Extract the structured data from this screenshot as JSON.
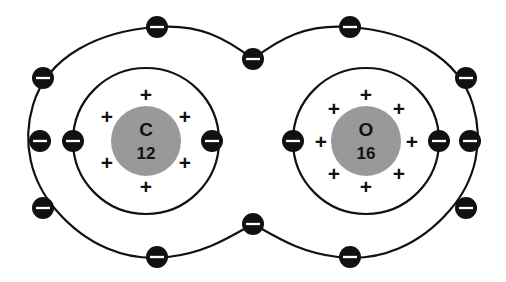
{
  "diagram": {
    "background_color": "#ffffff",
    "line_color": "#111111",
    "nucleus_color": "#999999",
    "electron_color": "#111111",
    "electron_bar_color": "#ffffff",
    "proton_symbol": "+",
    "electron_symbol": "−"
  },
  "atoms": [
    {
      "id": "carbon",
      "element_symbol": "C",
      "mass_number": "12",
      "nucleus": {
        "cx": 146,
        "cy": 141,
        "r": 35
      },
      "proton_count": 6,
      "protons": [
        {
          "x": 146,
          "y": 96
        },
        {
          "x": 107,
          "y": 118
        },
        {
          "x": 185,
          "y": 118
        },
        {
          "x": 107,
          "y": 164
        },
        {
          "x": 185,
          "y": 164
        },
        {
          "x": 146,
          "y": 188
        }
      ],
      "inner_shell": {
        "cx": 146,
        "cy": 141,
        "r": 73
      },
      "inner_shell_electron_count": 2,
      "inner_shell_electrons": [
        {
          "x": 73,
          "y": 141
        },
        {
          "x": 212,
          "y": 141
        }
      ]
    },
    {
      "id": "oxygen",
      "element_symbol": "O",
      "mass_number": "16",
      "nucleus": {
        "cx": 366,
        "cy": 141,
        "r": 35
      },
      "proton_count": 8,
      "protons": [
        {
          "x": 366,
          "y": 96
        },
        {
          "x": 334,
          "y": 110
        },
        {
          "x": 399,
          "y": 110
        },
        {
          "x": 321,
          "y": 143
        },
        {
          "x": 412,
          "y": 143
        },
        {
          "x": 334,
          "y": 175
        },
        {
          "x": 399,
          "y": 175
        },
        {
          "x": 366,
          "y": 188
        }
      ],
      "inner_shell": {
        "cx": 366,
        "cy": 141,
        "r": 73
      },
      "inner_shell_electron_count": 2,
      "inner_shell_electrons": [
        {
          "x": 293,
          "y": 141
        },
        {
          "x": 439,
          "y": 141
        }
      ]
    }
  ],
  "outer_shell": {
    "description": "Shared figure-eight bonding shell around both atoms",
    "electron_count": 12,
    "electrons": [
      {
        "x": 157,
        "y": 27
      },
      {
        "x": 253,
        "y": 59
      },
      {
        "x": 350,
        "y": 27
      },
      {
        "x": 466,
        "y": 78
      },
      {
        "x": 466,
        "y": 208
      },
      {
        "x": 350,
        "y": 257
      },
      {
        "x": 253,
        "y": 224
      },
      {
        "x": 157,
        "y": 257
      },
      {
        "x": 43,
        "y": 208
      },
      {
        "x": 43,
        "y": 78
      },
      {
        "x": 40,
        "y": 141
      },
      {
        "x": 470,
        "y": 141
      }
    ]
  },
  "counts": {
    "carbon_protons": 6,
    "oxygen_protons": 8,
    "carbon_inner_electrons": 2,
    "oxygen_inner_electrons": 2,
    "shared_outer_electrons": 12
  }
}
